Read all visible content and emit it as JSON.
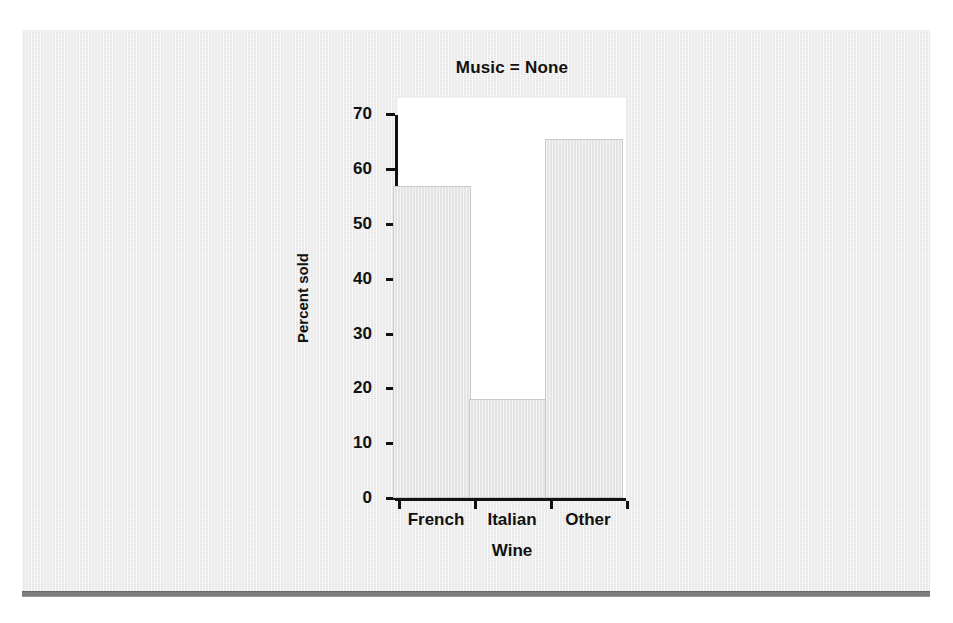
{
  "chart_data": {
    "type": "bar",
    "title": "Music = None",
    "xlabel": "Wine",
    "ylabel": "Percent sold",
    "categories": [
      "French",
      "Italian",
      "Other"
    ],
    "values": [
      57,
      18,
      65.5
    ],
    "ylim": [
      0,
      73
    ],
    "yticks": [
      0,
      10,
      20,
      30,
      40,
      50,
      60,
      70
    ],
    "ytick_labels": [
      "0",
      "10",
      "20",
      "30",
      "40",
      "50",
      "60",
      "70"
    ],
    "grid": false,
    "legend": "none",
    "bar_color": "#e9e9ea",
    "bar_edge_color": "#c9c9cb",
    "axis_color": "#111111",
    "panel_color": "#ececed",
    "plot_background": "#ffffff",
    "rule_color": "#7d7d7d"
  }
}
